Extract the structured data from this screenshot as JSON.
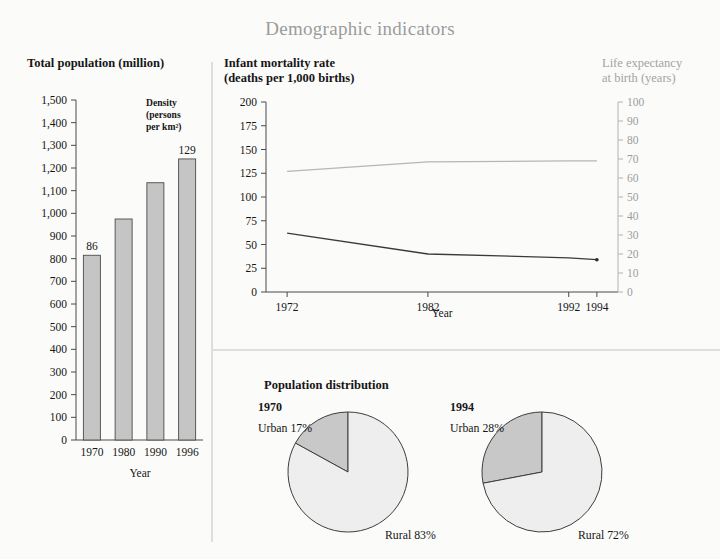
{
  "title": "Demographic indicators",
  "panels": {
    "bar": {
      "heading": "Total population (million)",
      "annotation": [
        "Density",
        "(persons",
        "per km²)"
      ],
      "xlabel": "Year"
    },
    "line": {
      "heading_line1": "Infant mortality rate",
      "heading_line2": "(deaths per 1,000 births)",
      "right_axis_line1": "Life expectancy",
      "right_axis_line2": "at birth (years)",
      "xlabel": "Year"
    },
    "pies": {
      "heading": "Population distribution",
      "charts": [
        {
          "year": "1970",
          "urban_label": "Urban 17%",
          "rural_label": "Rural 83%",
          "urban": 17,
          "rural": 83
        },
        {
          "year": "1994",
          "urban_label": "Urban 28%",
          "rural_label": "Rural 72%",
          "urban": 28,
          "rural": 72
        }
      ]
    }
  },
  "chart_data": [
    {
      "type": "bar",
      "title": "Total population (million)",
      "xlabel": "Year",
      "ylabel": "",
      "categories": [
        "1970",
        "1980",
        "1990",
        "1996"
      ],
      "values": [
        815,
        975,
        1135,
        1240
      ],
      "ylim": [
        0,
        1500
      ],
      "yticks": [
        0,
        100,
        200,
        300,
        400,
        500,
        600,
        700,
        800,
        900,
        1000,
        1100,
        1200,
        1300,
        1400,
        1500
      ],
      "ytick_labels": [
        "0",
        "100",
        "200",
        "300",
        "400",
        "500",
        "600",
        "700",
        "800",
        "900",
        "1,000",
        "1,100",
        "1,200",
        "1,300",
        "1,400",
        "1,500"
      ],
      "annotations": [
        {
          "text": "86",
          "category": "1970"
        },
        {
          "text": "129",
          "category": "1996"
        },
        {
          "text": "Density (persons per km²)",
          "category": "1990"
        }
      ],
      "grid": false,
      "legend": "none"
    },
    {
      "type": "line",
      "title": "Infant mortality rate (deaths per 1,000 births)",
      "xlabel": "Year",
      "ylabel": "Infant mortality rate (deaths per 1,000 births)",
      "y2label": "Life expectancy at birth (years)",
      "x": [
        1972,
        1982,
        1992,
        1994
      ],
      "xticks": [
        1972,
        1982,
        1992,
        1994
      ],
      "xtick_labels": [
        "1972",
        "1982",
        "1992",
        "1994"
      ],
      "ylim": [
        0,
        200
      ],
      "yticks": [
        0,
        25,
        50,
        75,
        100,
        125,
        150,
        175,
        200
      ],
      "ytick_labels": [
        "0",
        "25",
        "50",
        "75",
        "100",
        "125",
        "150",
        "175",
        "200"
      ],
      "y2lim": [
        0,
        100
      ],
      "y2ticks": [
        0,
        10,
        20,
        30,
        40,
        50,
        60,
        70,
        80,
        90,
        100
      ],
      "y2tick_labels": [
        "0",
        "10",
        "20",
        "30",
        "40",
        "50",
        "60",
        "70",
        "80",
        "90",
        "100"
      ],
      "series": [
        {
          "name": "Infant mortality rate",
          "axis": "left",
          "values": [
            62,
            40,
            36,
            34
          ],
          "color": "#3a3a3a"
        },
        {
          "name": "Life expectancy at birth",
          "axis": "right",
          "values": [
            63.5,
            68.5,
            69,
            69
          ],
          "color": "#b6b6b6"
        }
      ],
      "grid": false,
      "legend": "none"
    },
    {
      "type": "pie",
      "title": "Population distribution 1970",
      "labels": [
        "Urban 17%",
        "Rural 83%"
      ],
      "values": [
        17,
        83
      ],
      "colors": [
        "#c8c8c8",
        "#eeeeee"
      ]
    },
    {
      "type": "pie",
      "title": "Population distribution 1994",
      "labels": [
        "Urban 28%",
        "Rural 72%"
      ],
      "values": [
        28,
        72
      ],
      "colors": [
        "#c8c8c8",
        "#eeeeee"
      ]
    }
  ]
}
